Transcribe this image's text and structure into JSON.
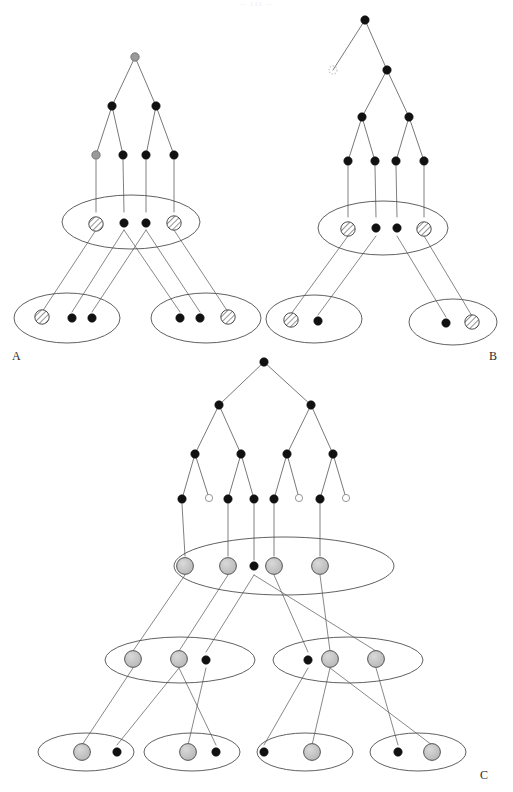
{
  "figure": {
    "header_fragment": "— 111 —",
    "panels": [
      {
        "id": "A",
        "label": "A"
      },
      {
        "id": "B",
        "label": "B"
      },
      {
        "id": "C",
        "label": "C"
      }
    ]
  },
  "style": {
    "stroke": "#3a3a3a",
    "stroke_light": "#555555",
    "node_filled": "#111111",
    "node_gray": "#9a9a9a",
    "node_open_fill": "#ffffff",
    "hatch_fill": "#f2f2f2",
    "ellipse_stroke": "#444444",
    "background": "#ffffff"
  },
  "panel_A": {
    "label": "A",
    "tree": {
      "root": {
        "x": 135,
        "y": 57,
        "kind": "gray"
      },
      "level2": [
        {
          "x": 112,
          "y": 106,
          "kind": "filled"
        },
        {
          "x": 156,
          "y": 106,
          "kind": "filled"
        }
      ],
      "leaves": [
        {
          "x": 96,
          "y": 155,
          "kind": "gray"
        },
        {
          "x": 123,
          "y": 155,
          "kind": "filled"
        },
        {
          "x": 146,
          "y": 155,
          "kind": "filled"
        },
        {
          "x": 174,
          "y": 155,
          "kind": "filled"
        }
      ],
      "edges": [
        [
          135,
          57,
          112,
          106
        ],
        [
          135,
          57,
          156,
          106
        ],
        [
          112,
          106,
          96,
          155
        ],
        [
          112,
          106,
          123,
          155
        ],
        [
          156,
          106,
          146,
          155
        ],
        [
          156,
          106,
          174,
          155
        ]
      ]
    },
    "top_ellipse": {
      "cx": 131,
      "cy": 222,
      "rx": 69,
      "ry": 27
    },
    "top_nodes": [
      {
        "x": 96,
        "y": 224,
        "kind": "hatched"
      },
      {
        "x": 124,
        "y": 223,
        "kind": "filled"
      },
      {
        "x": 146,
        "y": 223,
        "kind": "filled"
      },
      {
        "x": 174,
        "y": 223,
        "kind": "hatched"
      }
    ],
    "drop_lines": [
      [
        96,
        160,
        96,
        212
      ],
      [
        123,
        160,
        124,
        212
      ],
      [
        146,
        160,
        146,
        212
      ],
      [
        174,
        160,
        174,
        212
      ]
    ],
    "bottom_ellipses": [
      {
        "cx": 67,
        "cy": 318,
        "rx": 53,
        "ry": 25
      },
      {
        "cx": 206,
        "cy": 318,
        "rx": 55,
        "ry": 25
      }
    ],
    "bottom_nodes": [
      {
        "x": 42,
        "y": 317,
        "kind": "hatched"
      },
      {
        "x": 72,
        "y": 318,
        "kind": "filled"
      },
      {
        "x": 92,
        "y": 318,
        "kind": "filled"
      },
      {
        "x": 180,
        "y": 318,
        "kind": "filled"
      },
      {
        "x": 200,
        "y": 318,
        "kind": "filled"
      },
      {
        "x": 228,
        "y": 317,
        "kind": "hatched"
      }
    ],
    "cross_edges": [
      [
        96,
        230,
        42,
        312
      ],
      [
        124,
        230,
        72,
        312
      ],
      [
        146,
        230,
        92,
        312
      ],
      [
        124,
        230,
        180,
        312
      ],
      [
        146,
        230,
        200,
        312
      ],
      [
        174,
        230,
        228,
        312
      ]
    ]
  },
  "panel_B": {
    "label": "B",
    "tree": {
      "root": {
        "x": 365,
        "y": 20,
        "kind": "filled"
      },
      "nodes": [
        {
          "x": 333,
          "y": 70,
          "kind": "open-dotted"
        },
        {
          "x": 387,
          "y": 70,
          "kind": "filled"
        },
        {
          "x": 362,
          "y": 117,
          "kind": "filled"
        },
        {
          "x": 409,
          "y": 117,
          "kind": "filled"
        }
      ],
      "leaves": [
        {
          "x": 348,
          "y": 161,
          "kind": "filled"
        },
        {
          "x": 375,
          "y": 161,
          "kind": "filled"
        },
        {
          "x": 396,
          "y": 161,
          "kind": "filled"
        },
        {
          "x": 424,
          "y": 161,
          "kind": "filled"
        }
      ],
      "edges": [
        [
          365,
          20,
          333,
          70
        ],
        [
          365,
          20,
          387,
          70
        ],
        [
          387,
          70,
          362,
          117
        ],
        [
          387,
          70,
          409,
          117
        ],
        [
          362,
          117,
          348,
          161
        ],
        [
          362,
          117,
          375,
          161
        ],
        [
          409,
          117,
          396,
          161
        ],
        [
          409,
          117,
          424,
          161
        ]
      ]
    },
    "top_ellipse": {
      "cx": 383,
      "cy": 228,
      "rx": 65,
      "ry": 27
    },
    "top_nodes": [
      {
        "x": 348,
        "y": 229,
        "kind": "hatched"
      },
      {
        "x": 376,
        "y": 228,
        "kind": "filled"
      },
      {
        "x": 397,
        "y": 228,
        "kind": "filled"
      },
      {
        "x": 424,
        "y": 229,
        "kind": "hatched"
      }
    ],
    "drop_lines": [
      [
        348,
        166,
        348,
        217
      ],
      [
        375,
        166,
        376,
        217
      ],
      [
        396,
        166,
        397,
        217
      ],
      [
        424,
        166,
        424,
        217
      ]
    ],
    "bottom_ellipses": [
      {
        "cx": 314,
        "cy": 319,
        "rx": 48,
        "ry": 24
      },
      {
        "cx": 453,
        "cy": 322,
        "rx": 44,
        "ry": 23
      }
    ],
    "bottom_nodes": [
      {
        "x": 291,
        "y": 320,
        "kind": "hatched"
      },
      {
        "x": 318,
        "y": 321,
        "kind": "filled"
      },
      {
        "x": 446,
        "y": 323,
        "kind": "filled"
      },
      {
        "x": 472,
        "y": 322,
        "kind": "hatched"
      }
    ],
    "cross_edges": [
      [
        348,
        236,
        291,
        314
      ],
      [
        376,
        236,
        318,
        315
      ],
      [
        397,
        236,
        446,
        317
      ],
      [
        424,
        236,
        472,
        316
      ]
    ]
  },
  "panel_C": {
    "label": "C",
    "tree": {
      "root": {
        "x": 264,
        "y": 362,
        "kind": "filled"
      },
      "level2": [
        {
          "x": 219,
          "y": 405,
          "kind": "filled"
        },
        {
          "x": 311,
          "y": 405,
          "kind": "filled"
        }
      ],
      "level3": [
        {
          "x": 195,
          "y": 454,
          "kind": "filled"
        },
        {
          "x": 241,
          "y": 454,
          "kind": "filled"
        },
        {
          "x": 287,
          "y": 454,
          "kind": "filled"
        },
        {
          "x": 333,
          "y": 454,
          "kind": "filled"
        }
      ],
      "leaves": [
        {
          "x": 182,
          "y": 499,
          "kind": "filled"
        },
        {
          "x": 209,
          "y": 498,
          "kind": "open"
        },
        {
          "x": 228,
          "y": 499,
          "kind": "filled"
        },
        {
          "x": 254,
          "y": 499,
          "kind": "filled"
        },
        {
          "x": 274,
          "y": 499,
          "kind": "filled"
        },
        {
          "x": 299,
          "y": 498,
          "kind": "open"
        },
        {
          "x": 320,
          "y": 499,
          "kind": "filled"
        },
        {
          "x": 346,
          "y": 498,
          "kind": "open"
        }
      ],
      "edges": [
        [
          264,
          362,
          219,
          405
        ],
        [
          264,
          362,
          311,
          405
        ],
        [
          219,
          405,
          195,
          454
        ],
        [
          219,
          405,
          241,
          454
        ],
        [
          311,
          405,
          287,
          454
        ],
        [
          311,
          405,
          333,
          454
        ],
        [
          195,
          454,
          182,
          499
        ],
        [
          195,
          454,
          209,
          498
        ],
        [
          241,
          454,
          228,
          499
        ],
        [
          241,
          454,
          254,
          499
        ],
        [
          287,
          454,
          274,
          499
        ],
        [
          287,
          454,
          299,
          498
        ],
        [
          333,
          454,
          320,
          499
        ],
        [
          333,
          454,
          346,
          498
        ]
      ]
    },
    "top_ellipse": {
      "cx": 284,
      "cy": 566,
      "rx": 110,
      "ry": 29
    },
    "top_nodes": [
      {
        "x": 185,
        "y": 566,
        "kind": "circle-gray"
      },
      {
        "x": 228,
        "y": 566,
        "kind": "circle-gray"
      },
      {
        "x": 254,
        "y": 566,
        "kind": "filled"
      },
      {
        "x": 274,
        "y": 566,
        "kind": "circle-gray"
      },
      {
        "x": 320,
        "y": 566,
        "kind": "circle-gray"
      }
    ],
    "drop_lines": [
      [
        182,
        504,
        185,
        556
      ],
      [
        228,
        504,
        228,
        556
      ],
      [
        254,
        504,
        254,
        560
      ],
      [
        274,
        504,
        274,
        556
      ],
      [
        320,
        504,
        320,
        556
      ]
    ],
    "mid_ellipses": [
      {
        "cx": 180,
        "cy": 660,
        "rx": 75,
        "ry": 23
      },
      {
        "cx": 348,
        "cy": 660,
        "rx": 75,
        "ry": 23
      }
    ],
    "mid_nodes": [
      {
        "x": 133,
        "y": 659,
        "kind": "circle-gray"
      },
      {
        "x": 179,
        "y": 659,
        "kind": "circle-gray"
      },
      {
        "x": 206,
        "y": 660,
        "kind": "filled"
      },
      {
        "x": 308,
        "y": 660,
        "kind": "filled"
      },
      {
        "x": 330,
        "y": 659,
        "kind": "circle-gray"
      },
      {
        "x": 376,
        "y": 659,
        "kind": "circle-gray"
      }
    ],
    "mid_edges": [
      [
        185,
        575,
        133,
        651
      ],
      [
        228,
        575,
        179,
        651
      ],
      [
        254,
        575,
        206,
        652
      ],
      [
        274,
        575,
        308,
        652
      ],
      [
        320,
        575,
        330,
        651
      ],
      [
        254,
        575,
        376,
        651
      ]
    ],
    "bottom_ellipses": [
      {
        "cx": 86,
        "cy": 752,
        "rx": 48,
        "ry": 19
      },
      {
        "cx": 192,
        "cy": 752,
        "rx": 48,
        "ry": 19
      },
      {
        "cx": 305,
        "cy": 752,
        "rx": 48,
        "ry": 19
      },
      {
        "cx": 418,
        "cy": 752,
        "rx": 48,
        "ry": 19
      }
    ],
    "bottom_nodes": [
      {
        "x": 82,
        "y": 752,
        "kind": "circle-gray"
      },
      {
        "x": 117,
        "y": 752,
        "kind": "filled"
      },
      {
        "x": 188,
        "y": 752,
        "kind": "circle-gray"
      },
      {
        "x": 216,
        "y": 752,
        "kind": "filled"
      },
      {
        "x": 264,
        "y": 752,
        "kind": "filled"
      },
      {
        "x": 312,
        "y": 752,
        "kind": "circle-gray"
      },
      {
        "x": 398,
        "y": 752,
        "kind": "filled"
      },
      {
        "x": 432,
        "y": 752,
        "kind": "circle-gray"
      }
    ],
    "bottom_edges": [
      [
        133,
        668,
        82,
        745
      ],
      [
        179,
        668,
        117,
        745
      ],
      [
        206,
        668,
        188,
        745
      ],
      [
        179,
        668,
        216,
        745
      ],
      [
        308,
        668,
        264,
        745
      ],
      [
        330,
        668,
        312,
        745
      ],
      [
        376,
        668,
        398,
        745
      ],
      [
        330,
        668,
        432,
        745
      ]
    ]
  },
  "chart_data": {
    "type": "diagram",
    "panels": [
      {
        "name": "A",
        "tree_leaves": 4,
        "tree_levels": 3,
        "set_layers": [
          {
            "ellipses": 1,
            "nodes": 4,
            "hatched": 2,
            "filled": 2
          },
          {
            "ellipses": 2,
            "nodes": 6,
            "hatched": 2,
            "filled": 4
          }
        ]
      },
      {
        "name": "B",
        "tree_leaves": 4,
        "tree_levels": 4,
        "open_nodes": 1,
        "set_layers": [
          {
            "ellipses": 1,
            "nodes": 4,
            "hatched": 2,
            "filled": 2
          },
          {
            "ellipses": 2,
            "nodes": 4,
            "hatched": 2,
            "filled": 2
          }
        ]
      },
      {
        "name": "C",
        "tree_leaves": 8,
        "tree_levels": 4,
        "open_leaves": 3,
        "set_layers": [
          {
            "ellipses": 1,
            "nodes": 5,
            "gray_circles": 4,
            "filled": 1
          },
          {
            "ellipses": 2,
            "nodes": 6,
            "gray_circles": 4,
            "filled": 2
          },
          {
            "ellipses": 4,
            "nodes": 8,
            "gray_circles": 4,
            "filled": 4
          }
        ]
      }
    ]
  }
}
